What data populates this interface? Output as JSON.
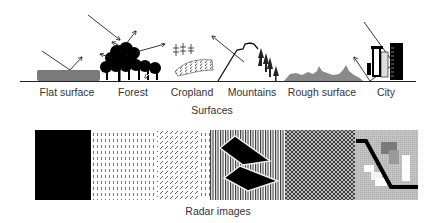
{
  "figure": {
    "surfaces_section": {
      "caption": "Surfaces",
      "labels": [
        {
          "id": "flat",
          "text": "Flat  surface"
        },
        {
          "id": "forest",
          "text": "Forest"
        },
        {
          "id": "cropland",
          "text": "Cropland"
        },
        {
          "id": "mountains",
          "text": "Mountains"
        },
        {
          "id": "rough",
          "text": "Rough surface"
        },
        {
          "id": "city",
          "text": "City"
        }
      ]
    },
    "radar_section": {
      "caption": "Radar images",
      "panels": [
        {
          "id": "flat",
          "pattern": "solid-black"
        },
        {
          "id": "forest",
          "pattern": "sparse-dots"
        },
        {
          "id": "cropland",
          "pattern": "diagonal-dashes-rows"
        },
        {
          "id": "mountains",
          "pattern": "vertical-stripes-with-black-shapes"
        },
        {
          "id": "rough",
          "pattern": "dense-crosshatch"
        },
        {
          "id": "city",
          "pattern": "gray-with-black-line-and-blocks"
        }
      ]
    },
    "colors": {
      "ground": "#222222",
      "flat_surface": "#7a7a7a",
      "rough_surface": "#8a8a8a",
      "black": "#000000",
      "label_text": "#333333"
    }
  }
}
